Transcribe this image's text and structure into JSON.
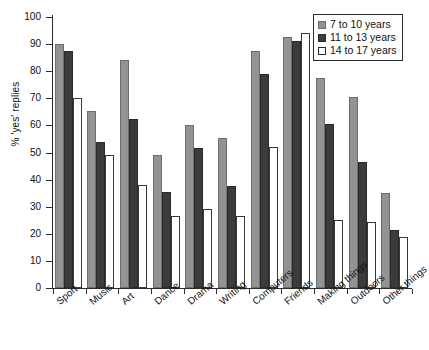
{
  "chart_data": {
    "type": "bar",
    "title": "",
    "xlabel": "",
    "ylabel": "% 'yes' replies",
    "ylim": [
      0,
      100
    ],
    "yticks": [
      0,
      10,
      20,
      30,
      40,
      50,
      60,
      70,
      80,
      90,
      100
    ],
    "grid": false,
    "legend_position": "top-right",
    "categories": [
      "Sport",
      "Music",
      "Art",
      "Dance",
      "Drama",
      "Writing",
      "Computers",
      "Friends",
      "Making things",
      "Outdoors",
      "Other things"
    ],
    "series": [
      {
        "name": "7 to 10 years",
        "color": "#939393",
        "values": [
          90,
          65.5,
          84,
          49,
          60,
          55.5,
          87.5,
          92.5,
          77.5,
          70.5,
          35
        ]
      },
      {
        "name": "11 to 13 years",
        "color": "#3b3b3b",
        "values": [
          87.5,
          54,
          62.5,
          35.5,
          51.5,
          37.5,
          79,
          91,
          60.5,
          46.5,
          21.5
        ]
      },
      {
        "name": "14 to 17 years",
        "color": "#ffffff",
        "values": [
          70,
          49,
          38,
          26.5,
          29,
          26.5,
          52,
          94,
          25,
          24.5,
          19
        ]
      }
    ]
  }
}
